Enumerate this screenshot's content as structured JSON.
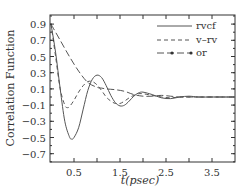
{
  "chart_data": {
    "type": "line",
    "title": "",
    "xlabel": "t(psec)",
    "ylabel": "Correlation Function",
    "xlim": [
      0.0,
      4.0
    ],
    "ylim": [
      -0.8,
      1.0
    ],
    "xticks": [
      "0.5",
      "1.5",
      "2.5",
      "3.5"
    ],
    "xtick_values": [
      0.5,
      1.5,
      2.5,
      3.5
    ],
    "yticks": [
      "0.9",
      "0.7",
      "0.5",
      "0.3",
      "0.1",
      "-0.1",
      "-0.3",
      "-0.5",
      "-0.7"
    ],
    "ytick_values": [
      0.9,
      0.7,
      0.5,
      0.3,
      0.1,
      -0.1,
      -0.3,
      -0.5,
      -0.7
    ],
    "grid": false,
    "legend_position": "upper right",
    "series": [
      {
        "name": "rvcf",
        "style": "solid",
        "x": [
          0.0,
          0.1,
          0.2,
          0.3,
          0.4,
          0.45,
          0.5,
          0.6,
          0.7,
          0.8,
          0.9,
          1.0,
          1.1,
          1.2,
          1.3,
          1.4,
          1.5,
          1.6,
          1.7,
          1.8,
          1.9,
          2.0,
          2.2,
          2.4,
          2.6,
          2.8,
          3.0,
          3.2,
          3.5,
          3.8,
          4.0
        ],
        "values": [
          0.9,
          0.55,
          0.1,
          -0.3,
          -0.49,
          -0.52,
          -0.5,
          -0.38,
          -0.15,
          0.08,
          0.22,
          0.27,
          0.24,
          0.14,
          0.02,
          -0.07,
          -0.11,
          -0.1,
          -0.05,
          0.01,
          0.05,
          0.06,
          0.03,
          -0.01,
          -0.02,
          0.0,
          0.01,
          0.0,
          0.0,
          0.0,
          0.0
        ]
      },
      {
        "name": "v–rv",
        "style": "dashed",
        "x": [
          0.0,
          0.1,
          0.2,
          0.3,
          0.35,
          0.4,
          0.5,
          0.6,
          0.7,
          0.8,
          0.9,
          1.0,
          1.1,
          1.2,
          1.3,
          1.4,
          1.5,
          1.6,
          1.7,
          1.8,
          1.9,
          2.0,
          2.2,
          2.4,
          2.6,
          2.8,
          3.0,
          3.5,
          4.0
        ],
        "values": [
          0.9,
          0.5,
          0.1,
          -0.1,
          -0.13,
          -0.12,
          -0.04,
          0.06,
          0.14,
          0.19,
          0.19,
          0.15,
          0.08,
          0.0,
          -0.05,
          -0.08,
          -0.08,
          -0.05,
          -0.01,
          0.02,
          0.04,
          0.04,
          0.02,
          0.0,
          -0.01,
          0.0,
          0.0,
          0.0,
          0.0
        ]
      },
      {
        "name": "or",
        "style": "dash-dot-marker",
        "x": [
          0.0,
          0.2,
          0.4,
          0.6,
          0.8,
          1.0,
          1.1,
          1.2,
          1.4,
          1.6,
          1.8,
          2.0,
          2.2,
          2.4,
          2.6,
          2.8,
          3.0,
          3.5,
          4.0
        ],
        "values": [
          0.9,
          0.7,
          0.5,
          0.32,
          0.18,
          0.12,
          0.11,
          0.1,
          0.09,
          0.07,
          0.03,
          0.01,
          0.01,
          0.02,
          0.01,
          0.0,
          0.0,
          0.0,
          0.0
        ]
      }
    ]
  },
  "legend": {
    "items": [
      {
        "label": "rvcf",
        "style": "solid"
      },
      {
        "label": "v–rv",
        "style": "dashed"
      },
      {
        "label": "or",
        "style": "dash-dot-marker"
      }
    ]
  },
  "axes": {
    "xlabel": "t(psec)",
    "ylabel": "Correlation Function"
  },
  "colors": {
    "line": "#555555",
    "axis": "#333333",
    "background": "#ffffff"
  }
}
